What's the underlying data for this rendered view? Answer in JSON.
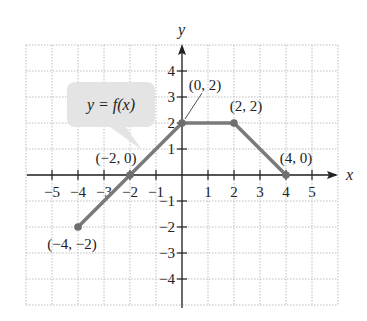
{
  "chart_data": {
    "type": "line",
    "title": "",
    "xlabel": "x",
    "ylabel": "y",
    "xlim": [
      -6,
      6
    ],
    "ylim": [
      -5,
      5
    ],
    "grid": true,
    "x_ticks": [
      -5,
      -4,
      -3,
      -2,
      -1,
      1,
      2,
      3,
      4,
      5
    ],
    "y_ticks": [
      -4,
      -3,
      -2,
      -1,
      1,
      2,
      3,
      4
    ],
    "x_tick_labels": [
      "−5",
      "−4",
      "−3",
      "−2",
      "−1",
      "1",
      "2",
      "3",
      "4",
      "5"
    ],
    "y_tick_labels": [
      "−4",
      "−3",
      "−2",
      "−1",
      "1",
      "2",
      "3",
      "4"
    ],
    "series": [
      {
        "name": "y = f(x)",
        "x": [
          -4,
          -2,
          0,
          2,
          4
        ],
        "y": [
          -2,
          0,
          2,
          2,
          0
        ]
      }
    ],
    "annotations": [
      {
        "text": "(−4, −2)",
        "x": -4,
        "y": -2
      },
      {
        "text": "(−2, 0)",
        "x": -2,
        "y": 0
      },
      {
        "text": "(0, 2)",
        "x": 0,
        "y": 2
      },
      {
        "text": "(2, 2)",
        "x": 2,
        "y": 2
      },
      {
        "text": "(4, 0)",
        "x": 4,
        "y": 0
      }
    ],
    "callout": "y = f(x)"
  },
  "colors": {
    "line": "#7a7a7a",
    "point": "#6e6e6e",
    "axis": "#222222",
    "grid": "#bdbdbd",
    "callout_bg": "#e4e4e4"
  }
}
